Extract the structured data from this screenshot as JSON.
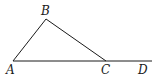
{
  "diagram": {
    "type": "geometry",
    "points": {
      "A": {
        "label": "A",
        "x": 13,
        "y": 61,
        "lx": 6,
        "ly": 74
      },
      "B": {
        "label": "B",
        "x": 46,
        "y": 19,
        "lx": 41,
        "ly": 15
      },
      "C": {
        "label": "C",
        "x": 106,
        "y": 61,
        "lx": 101,
        "ly": 74
      },
      "D": {
        "label": "D",
        "x": 152,
        "y": 61,
        "lx": 138,
        "ly": 74
      }
    },
    "segments": [
      {
        "from": "A",
        "to": "B"
      },
      {
        "from": "B",
        "to": "C"
      },
      {
        "from": "A",
        "to": "D"
      }
    ],
    "colors": {
      "stroke": "#1a1a1a",
      "background": "#ffffff"
    }
  }
}
